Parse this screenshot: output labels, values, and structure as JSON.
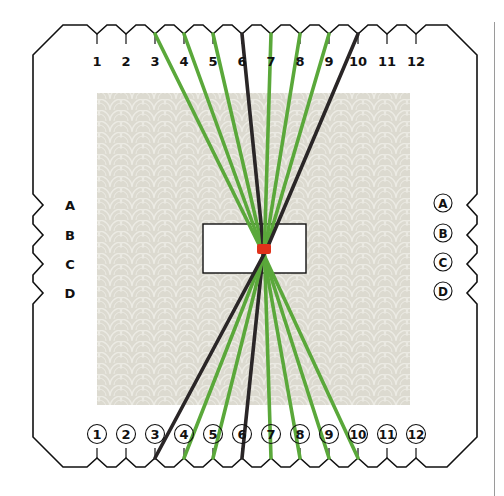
{
  "figure": {
    "colors": {
      "outline": "#111111",
      "pattern_base": "#dcdad0",
      "pattern_scale": "#ebe9e1",
      "green_strand": "#5aa83a",
      "black_strand": "#2a2627",
      "tie": "#e0311a",
      "divider": "#9a9a9a"
    }
  },
  "top_labels": [
    "1",
    "2",
    "3",
    "4",
    "5",
    "6",
    "7",
    "8",
    "9",
    "10",
    "11",
    "12"
  ],
  "bottom_labels": [
    "1",
    "2",
    "3",
    "4",
    "5",
    "6",
    "7",
    "8",
    "9",
    "10",
    "11",
    "12"
  ],
  "left_labels": [
    "A",
    "B",
    "C",
    "D"
  ],
  "right_labels": [
    "A",
    "B",
    "C",
    "D"
  ],
  "strands": [
    {
      "from_top": "3",
      "to_bottom": "10",
      "color": "green"
    },
    {
      "from_top": "4",
      "to_bottom": "9",
      "color": "green"
    },
    {
      "from_top": "5",
      "to_bottom": "8",
      "color": "green"
    },
    {
      "from_top": "6",
      "to_bottom": "6",
      "color": "black"
    },
    {
      "from_top": "7",
      "to_bottom": "7",
      "color": "green"
    },
    {
      "from_top": "8",
      "to_bottom": "5",
      "color": "green"
    },
    {
      "from_top": "9",
      "to_bottom": "4",
      "color": "green"
    },
    {
      "from_top": "10",
      "to_bottom": "3",
      "color": "black"
    }
  ],
  "center_tie": {
    "label": "",
    "color": "red"
  }
}
